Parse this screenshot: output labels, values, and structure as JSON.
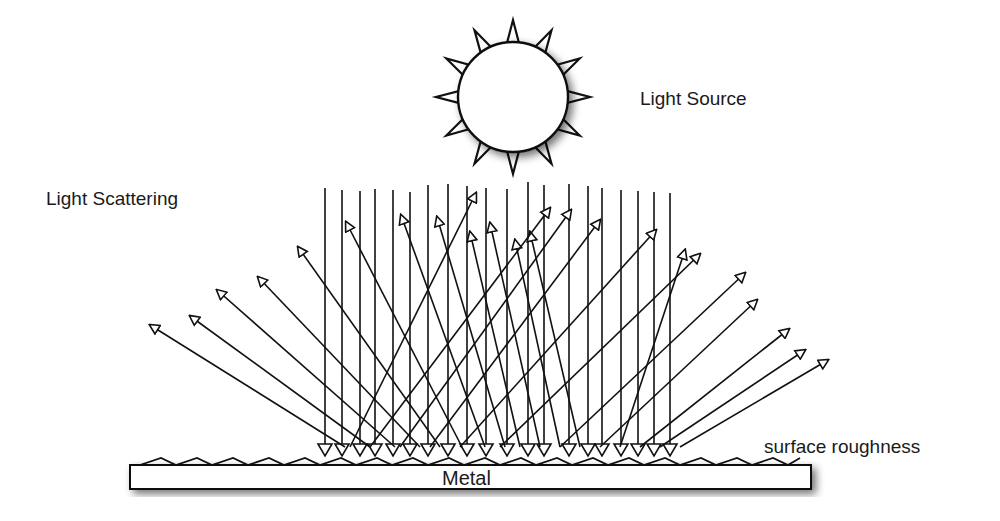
{
  "labels": {
    "light_source": "Light Source",
    "light_scattering": "Light Scattering",
    "surface_roughness": "surface roughness",
    "metal": "Metal"
  },
  "colors": {
    "stroke": "#111111",
    "background": "#ffffff"
  },
  "sun": {
    "cx": 513,
    "cy": 97,
    "r": 55,
    "spikes": 12
  },
  "incident_rays_x": [
    325,
    342,
    360,
    375,
    393,
    410,
    428,
    448,
    467,
    486,
    507,
    528,
    544,
    569,
    588,
    602,
    621,
    638,
    654,
    670
  ],
  "incident_top_y": [
    188,
    190,
    191,
    189,
    190,
    192,
    185,
    184,
    186,
    188,
    189,
    182,
    185,
    184,
    186,
    188,
    190,
    191,
    192,
    193
  ],
  "incident_bottom_y": 446,
  "scattered_rays": [
    [
      345,
      447,
      150,
      325
    ],
    [
      370,
      447,
      190,
      316
    ],
    [
      395,
      447,
      217,
      290
    ],
    [
      420,
      447,
      258,
      277
    ],
    [
      440,
      447,
      298,
      247
    ],
    [
      462,
      447,
      346,
      222
    ],
    [
      485,
      447,
      401,
      215
    ],
    [
      505,
      447,
      437,
      217
    ],
    [
      520,
      447,
      470,
      232
    ],
    [
      540,
      447,
      490,
      223
    ],
    [
      560,
      447,
      515,
      240
    ],
    [
      580,
      447,
      530,
      232
    ],
    [
      350,
      447,
      476,
      193
    ],
    [
      370,
      447,
      550,
      208
    ],
    [
      400,
      447,
      571,
      210
    ],
    [
      430,
      447,
      600,
      220
    ],
    [
      460,
      447,
      656,
      230
    ],
    [
      500,
      447,
      700,
      254
    ],
    [
      560,
      447,
      745,
      273
    ],
    [
      600,
      447,
      757,
      300
    ],
    [
      640,
      447,
      789,
      329
    ],
    [
      660,
      447,
      805,
      350
    ],
    [
      680,
      447,
      828,
      360
    ],
    [
      620,
      447,
      685,
      250
    ]
  ]
}
